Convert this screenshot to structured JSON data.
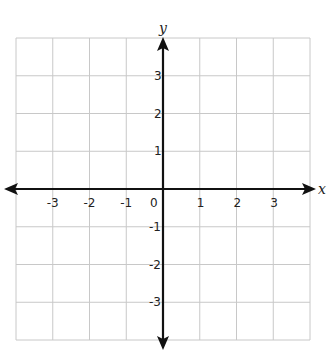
{
  "diagram": {
    "type": "coordinate-plane",
    "x_axis_label": "x",
    "y_axis_label": "y",
    "origin_label": "0",
    "x_ticks": [
      "-3",
      "-2",
      "-1",
      "1",
      "2",
      "3"
    ],
    "y_ticks": [
      "3",
      "2",
      "1",
      "-1",
      "-2",
      "-3"
    ],
    "grid": {
      "columns": 8,
      "rows": 8,
      "range_x": [
        -4,
        4
      ],
      "range_y": [
        -4,
        4
      ]
    },
    "colors": {
      "grid": "#c8c8c8",
      "axis": "#111111",
      "background": "#ffffff"
    }
  }
}
